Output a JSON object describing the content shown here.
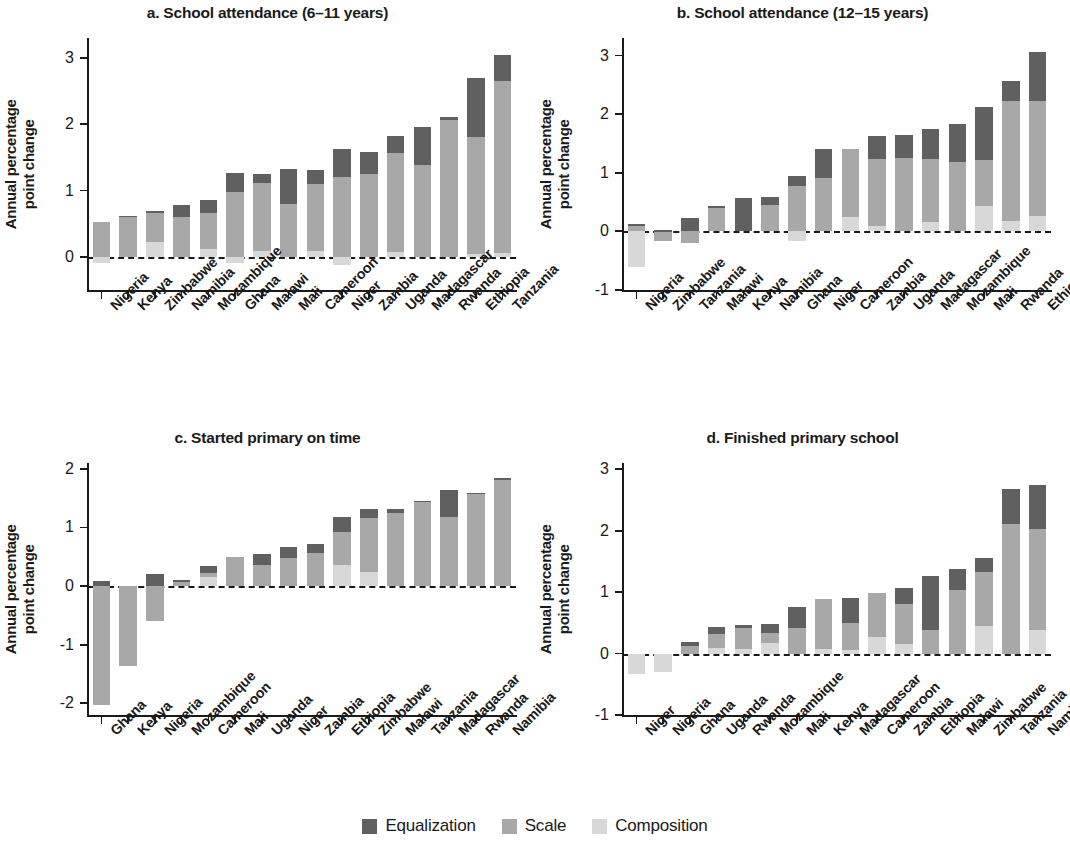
{
  "legend": {
    "items": [
      {
        "label": "Equalization",
        "color": "#606060",
        "key": "equalization"
      },
      {
        "label": "Scale",
        "color": "#a8a8a8",
        "key": "scale"
      },
      {
        "label": "Composition",
        "color": "#d8d8d8",
        "key": "composition"
      }
    ]
  },
  "common": {
    "ylabel": "Annual percentage\npoint change",
    "ylabel_line1": "Annual percentage",
    "ylabel_line2": "point change"
  },
  "chart_data": [
    {
      "id": "panel-a",
      "type": "bar",
      "stacked": true,
      "title": "a. School attendance (6–11 years)",
      "xlabel": "",
      "ylabel": "Annual percentage point change",
      "ylim": [
        -0.5,
        3.3
      ],
      "yticks": [
        0,
        1,
        2,
        3
      ],
      "ytick_labels": [
        "0",
        "1",
        "2",
        "3"
      ],
      "grid": false,
      "legend_position": "bottom-figure",
      "categories": [
        "Nigeria",
        "Kenya",
        "Zimbabwe",
        "Namibia",
        "Mozambique",
        "Ghana",
        "Malawi",
        "Mali",
        "Cameroon",
        "Niger",
        "Zambia",
        "Uganda",
        "Madagascar",
        "Rwanda",
        "Ethiopia",
        "Tanzania"
      ],
      "series": [
        {
          "name": "Composition",
          "values": [
            -0.09,
            0.0,
            0.22,
            0.0,
            0.12,
            -0.1,
            0.09,
            0.0,
            0.09,
            -0.12,
            0.0,
            0.07,
            0.0,
            0.0,
            0.05,
            0.06
          ]
        },
        {
          "name": "Scale",
          "values": [
            0.52,
            0.61,
            0.45,
            0.6,
            0.54,
            0.98,
            1.02,
            0.79,
            1.01,
            1.21,
            1.25,
            1.49,
            1.39,
            2.06,
            1.75,
            2.59
          ]
        },
        {
          "name": "Equalization",
          "values": [
            0.0,
            0.01,
            0.02,
            0.18,
            0.19,
            0.28,
            0.14,
            0.53,
            0.21,
            0.41,
            0.33,
            0.26,
            0.57,
            0.05,
            0.89,
            0.4
          ]
        }
      ],
      "totals": [
        0.43,
        0.62,
        0.69,
        0.78,
        0.85,
        1.26,
        1.25,
        1.32,
        1.31,
        1.5,
        1.58,
        1.82,
        1.96,
        2.11,
        2.69,
        3.05
      ]
    },
    {
      "id": "panel-b",
      "type": "bar",
      "stacked": true,
      "title": "b. School attendance (12–15 years)",
      "xlabel": "",
      "ylabel": "Annual percentage point change",
      "ylim": [
        -1,
        3.3
      ],
      "yticks": [
        -1,
        0,
        1,
        2,
        3
      ],
      "ytick_labels": [
        "-1",
        "0",
        "1",
        "2",
        "3"
      ],
      "grid": false,
      "legend_position": "bottom-figure",
      "categories": [
        "Nigeria",
        "Zimbabwe",
        "Tanzania",
        "Malawi",
        "Kenya",
        "Namibia",
        "Ghana",
        "Niger",
        "Cameroon",
        "Zambia",
        "Uganda",
        "Madagascar",
        "Mozambique",
        "Mali",
        "Rwanda",
        "Ethiopia"
      ],
      "series": [
        {
          "name": "Composition",
          "values": [
            -0.6,
            0.0,
            0.0,
            0.0,
            0.0,
            0.0,
            -0.17,
            0.0,
            0.24,
            0.1,
            0.0,
            0.16,
            0.0,
            0.44,
            0.17,
            0.26
          ]
        },
        {
          "name": "Scale",
          "values": [
            0.1,
            -0.17,
            -0.19,
            0.41,
            0.0,
            0.45,
            0.78,
            0.91,
            1.17,
            1.13,
            1.25,
            1.08,
            1.19,
            0.77,
            2.06,
            1.96
          ]
        },
        {
          "name": "Equalization",
          "values": [
            0.03,
            0.02,
            0.23,
            0.02,
            0.57,
            0.13,
            0.16,
            0.5,
            0.0,
            0.4,
            0.4,
            0.51,
            0.65,
            0.92,
            0.34,
            0.84
          ]
        }
      ],
      "totals": [
        0.13,
        -0.15,
        0.23,
        0.43,
        0.57,
        0.58,
        0.95,
        1.41,
        1.41,
        1.63,
        1.65,
        1.75,
        1.84,
        2.13,
        2.57,
        3.06
      ]
    },
    {
      "id": "panel-c",
      "type": "bar",
      "stacked": true,
      "title": "c. Started primary on time",
      "xlabel": "",
      "ylabel": "Annual percentage point change",
      "ylim": [
        -2.2,
        2.1
      ],
      "yticks": [
        -2,
        -1,
        0,
        1,
        2
      ],
      "ytick_labels": [
        "-2",
        "-1",
        "0",
        "1",
        "2"
      ],
      "grid": false,
      "legend_position": "bottom-figure",
      "categories": [
        "Ghana",
        "Kenya",
        "Nigeria",
        "Mozambique",
        "Cameroon",
        "Mali",
        "Uganda",
        "Niger",
        "Zambia",
        "Ethiopia",
        "Zimbabwe",
        "Malawi",
        "Tanzania",
        "Madagascar",
        "Rwanda",
        "Namibia"
      ],
      "series": [
        {
          "name": "Composition",
          "values": [
            0.0,
            0.0,
            0.0,
            0.0,
            0.15,
            0.0,
            0.0,
            0.0,
            0.0,
            0.36,
            0.24,
            0.0,
            0.0,
            0.0,
            0.0,
            0.0
          ]
        },
        {
          "name": "Scale",
          "values": [
            -2.03,
            -1.37,
            -0.6,
            0.08,
            0.08,
            0.5,
            0.36,
            0.48,
            0.56,
            0.56,
            0.92,
            1.25,
            1.44,
            1.18,
            1.57,
            1.82
          ]
        },
        {
          "name": "Equalization",
          "values": [
            0.08,
            0.0,
            0.2,
            0.02,
            0.11,
            0.0,
            0.18,
            0.18,
            0.15,
            0.26,
            0.16,
            0.06,
            0.02,
            0.46,
            0.02,
            0.02
          ]
        }
      ],
      "totals": [
        0.08,
        -1.37,
        0.2,
        0.1,
        0.34,
        0.5,
        0.54,
        0.66,
        0.71,
        1.18,
        1.32,
        1.31,
        1.46,
        1.64,
        1.59,
        1.84
      ]
    },
    {
      "id": "panel-d",
      "type": "bar",
      "stacked": true,
      "title": "d. Finished primary school",
      "xlabel": "",
      "ylabel": "Annual percentage point change",
      "ylim": [
        -1,
        3.1
      ],
      "yticks": [
        -1,
        0,
        1,
        2,
        3
      ],
      "ytick_labels": [
        "-1",
        "0",
        "1",
        "2",
        "3"
      ],
      "grid": false,
      "legend_position": "bottom-figure",
      "categories": [
        "Niger",
        "Nigeria",
        "Ghana",
        "Uganda",
        "Rwanda",
        "Mozambique",
        "Mali",
        "Kenya",
        "Madagascar",
        "Cameroon",
        "Zambia",
        "Ethiopia",
        "Malawi",
        "Zimbabwe",
        "Tanzania",
        "Namibia"
      ],
      "series": [
        {
          "name": "Composition",
          "values": [
            -0.34,
            -0.3,
            0.0,
            0.09,
            0.08,
            0.17,
            0.0,
            0.08,
            0.06,
            0.27,
            0.15,
            0.0,
            0.0,
            0.44,
            0.0,
            0.38
          ]
        },
        {
          "name": "Scale",
          "values": [
            0.0,
            0.0,
            0.13,
            0.22,
            0.33,
            0.16,
            0.41,
            0.81,
            0.44,
            0.71,
            0.65,
            0.38,
            1.04,
            0.89,
            2.11,
            1.65
          ]
        },
        {
          "name": "Equalization",
          "values": [
            0.0,
            0.0,
            0.06,
            0.12,
            0.06,
            0.15,
            0.34,
            0.0,
            0.4,
            0.0,
            0.26,
            0.88,
            0.34,
            0.22,
            0.56,
            0.72
          ]
        }
      ],
      "totals": [
        -0.34,
        -0.3,
        0.19,
        0.43,
        0.47,
        0.48,
        0.75,
        0.89,
        0.9,
        0.98,
        1.06,
        1.26,
        1.38,
        1.55,
        2.67,
        2.75
      ]
    }
  ]
}
